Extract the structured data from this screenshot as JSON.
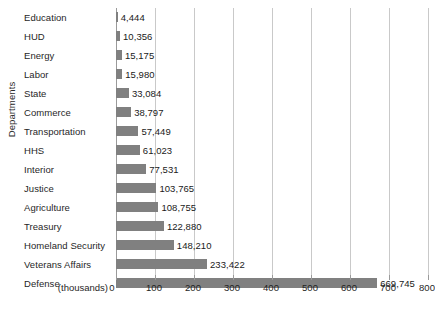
{
  "chart_data": {
    "type": "bar",
    "orientation": "horizontal",
    "title": "",
    "xlabel": "(thousands)",
    "ylabel": "Departments",
    "units_label": "(thousands)",
    "xlim": [
      0,
      800
    ],
    "xticks": [
      0,
      100,
      200,
      300,
      400,
      500,
      600,
      700,
      800
    ],
    "xtick_labels": [
      "0",
      "100",
      "200",
      "300",
      "400",
      "500",
      "600",
      "700",
      "800"
    ],
    "grid": true,
    "grid_axis": "x",
    "legend": false,
    "bar_color": "#808080",
    "gridline_color": "#c9c9c9",
    "background_color": "#ffffff",
    "categories": [
      "Education",
      "HUD",
      "Energy",
      "Labor",
      "State",
      "Commerce",
      "Transportation",
      "HHS",
      "Interior",
      "Justice",
      "Agriculture",
      "Treasury",
      "Homeland Security",
      "Veterans Affairs",
      "Defense"
    ],
    "values": [
      4444,
      10356,
      15175,
      15980,
      33084,
      38797,
      57449,
      61023,
      77531,
      103765,
      108755,
      122880,
      148210,
      233422,
      669745
    ],
    "value_labels": [
      "4,444",
      "10,356",
      "15,175",
      "15,980",
      "33,084",
      "38,797",
      "57,449",
      "61,023",
      "77,531",
      "103,765",
      "108,755",
      "122,880",
      "148,210",
      "233,422",
      "669,745"
    ]
  }
}
